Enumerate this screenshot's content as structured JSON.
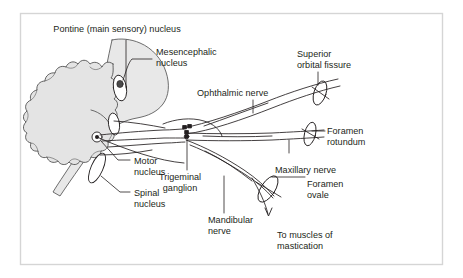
{
  "figure": {
    "frame_color": "#d5d5d5",
    "ink_color": "#231f20",
    "brainstem_fill": "#e8e8e8",
    "cerebellum_fill": "#e4e4e4",
    "background": "#ffffff",
    "label_font_size": 9.1
  },
  "labels": {
    "pontine_nucleus": "Pontine (main sensory) nucleus",
    "mesencephalic_nucleus_line1": "Mesencephalic",
    "mesencephalic_nucleus_line2": "nucleus",
    "superior_orbital_fissure_line1": "Superior",
    "superior_orbital_fissure_line2": "orbital fissure",
    "ophthalmic_nerve": "Ophthalmic nerve",
    "foramen_rotundum_line1": "Foramen",
    "foramen_rotundum_line2": "rotundum",
    "maxillary_nerve": "Maxillary nerve",
    "foramen_ovale_line1": "Foramen",
    "foramen_ovale_line2": "ovale",
    "motor_nucleus_line1": "Motor",
    "motor_nucleus_line2": "nucleus",
    "spinal_nucleus_line1": "Spinal",
    "spinal_nucleus_line2": "nucleus",
    "trigeminal_ganglion_line1": "Trigeminal",
    "trigeminal_ganglion_line2": "ganglion",
    "mandibular_nerve_line1": "Mandibular",
    "mandibular_nerve_line2": "nerve",
    "to_muscles_line1": "To muscles of",
    "to_muscles_line2": "mastication"
  },
  "structures": [
    {
      "name": "cerebellum",
      "kind": "lobulated-mass"
    },
    {
      "name": "brainstem",
      "kind": "shaded-column"
    },
    {
      "name": "mesencephalic-nucleus",
      "kind": "oval-dark-core"
    },
    {
      "name": "pontine-nucleus",
      "kind": "oval"
    },
    {
      "name": "motor-nucleus",
      "kind": "dot-in-circle"
    },
    {
      "name": "spinal-nucleus",
      "kind": "elongated-oval"
    },
    {
      "name": "trigeminal-ganglion",
      "kind": "cell-cluster"
    },
    {
      "name": "superior-orbital-fissure",
      "kind": "foramen-ellipse"
    },
    {
      "name": "foramen-rotundum",
      "kind": "foramen-ellipse"
    },
    {
      "name": "foramen-ovale",
      "kind": "foramen-ellipse"
    },
    {
      "name": "ophthalmic-nerve",
      "kind": "nerve-trunk"
    },
    {
      "name": "maxillary-nerve",
      "kind": "nerve-trunk"
    },
    {
      "name": "mandibular-nerve",
      "kind": "nerve-trunk"
    },
    {
      "name": "motor-branch-arrow",
      "kind": "arrow"
    }
  ]
}
